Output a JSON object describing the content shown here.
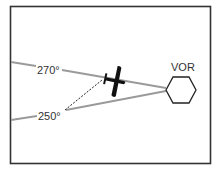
{
  "diagram": {
    "title": "",
    "station_label": "VOR",
    "radials": [
      {
        "label": "270°",
        "value": 270
      },
      {
        "label": "250°",
        "value": 250
      }
    ],
    "colors": {
      "frame": "#333333",
      "radial_line": "#9a9a9a",
      "airplane": "#111111",
      "station": "#222222",
      "dashed": "#222222"
    }
  }
}
